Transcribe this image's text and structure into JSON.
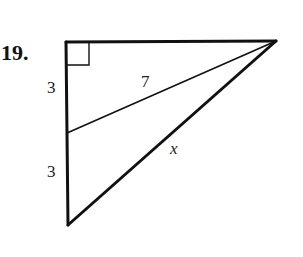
{
  "problem": {
    "number": "19."
  },
  "diagram": {
    "type": "right-triangle",
    "vertices": {
      "top_left": [
        66,
        42
      ],
      "top_right": [
        276,
        41
      ],
      "bottom": [
        68,
        225
      ]
    },
    "cevian_foot": [
      67,
      133
    ],
    "right_angle_marker_size": 22,
    "labels": {
      "upper_left_segment": "3",
      "lower_left_segment": "3",
      "cevian": "7",
      "hypotenuse": "x"
    },
    "stroke_color": "#111111",
    "background_color": "#ffffff"
  }
}
